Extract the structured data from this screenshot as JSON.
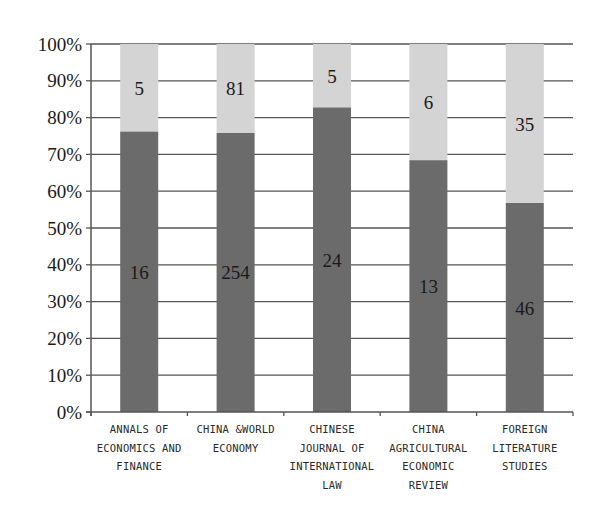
{
  "chart_data": {
    "type": "bar",
    "stacked": true,
    "normalized_percent": true,
    "title": "",
    "xlabel": "",
    "ylabel": "",
    "ylim": [
      0,
      100
    ],
    "y_ticks": [
      "0%",
      "10%",
      "20%",
      "30%",
      "40%",
      "50%",
      "60%",
      "70%",
      "80%",
      "90%",
      "100%"
    ],
    "grid": true,
    "legend": null,
    "categories": [
      "ANNALS OF ECONOMICS AND FINANCE",
      "CHINA &WORLD ECONOMY",
      "CHINESE JOURNAL OF INTERNATIONAL LAW",
      "CHINA AGRICULTURAL ECONOMIC REVIEW",
      "FOREIGN LITERATURE STUDIES"
    ],
    "category_label_lines": [
      [
        "ANNALS OF",
        "ECONOMICS AND",
        "FINANCE"
      ],
      [
        "CHINA &WORLD",
        "ECONOMY"
      ],
      [
        "CHINESE",
        "JOURNAL OF",
        "INTERNATIONAL",
        "LAW"
      ],
      [
        "CHINA",
        "AGRICULTURAL",
        "ECONOMIC",
        "REVIEW"
      ],
      [
        "FOREIGN",
        "LITERATURE",
        "STUDIES"
      ]
    ],
    "series": [
      {
        "name": "bottom (dark)",
        "color": "#6b6b6b",
        "values": [
          16,
          254,
          24,
          13,
          46
        ],
        "percent": [
          76.2,
          75.8,
          82.8,
          68.4,
          56.8
        ]
      },
      {
        "name": "top (light)",
        "color": "#d4d4d4",
        "values": [
          5,
          81,
          5,
          6,
          35
        ],
        "percent": [
          23.8,
          24.2,
          17.2,
          31.6,
          43.2
        ]
      }
    ]
  },
  "colors": {
    "dark_bar": "#6b6b6b",
    "light_bar": "#d4d4d4",
    "gridline": "#555555",
    "axis": "#555555",
    "text": "#1a1a1a"
  }
}
